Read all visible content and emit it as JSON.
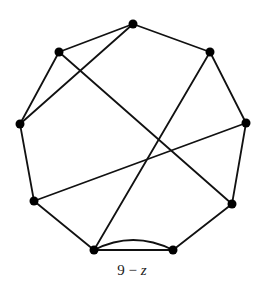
{
  "figure": {
    "caption_number": "9",
    "caption_operator": "−",
    "caption_variable": "z"
  },
  "graph": {
    "vertices": [
      {
        "id": "v_top",
        "x": 133,
        "y": 24
      },
      {
        "id": "v_top_right",
        "x": 210,
        "y": 52
      },
      {
        "id": "v_right",
        "x": 246,
        "y": 123
      },
      {
        "id": "v_lower_right",
        "x": 232,
        "y": 204
      },
      {
        "id": "v_bottom_right",
        "x": 173,
        "y": 250
      },
      {
        "id": "v_bottom_left",
        "x": 94,
        "y": 250
      },
      {
        "id": "v_lower_left",
        "x": 34,
        "y": 201
      },
      {
        "id": "v_left",
        "x": 20,
        "y": 124
      },
      {
        "id": "v_top_left",
        "x": 59,
        "y": 52
      }
    ],
    "edges": [
      [
        "v_top_left",
        "v_top"
      ],
      [
        "v_top",
        "v_top_right"
      ],
      [
        "v_top_right",
        "v_right"
      ],
      [
        "v_right",
        "v_lower_right"
      ],
      [
        "v_lower_right",
        "v_bottom_right"
      ],
      [
        "v_bottom_right",
        "v_bottom_left"
      ],
      [
        "v_bottom_right",
        "v_bottom_left",
        "arc"
      ],
      [
        "v_bottom_left",
        "v_lower_left"
      ],
      [
        "v_lower_left",
        "v_left"
      ],
      [
        "v_left",
        "v_top_left"
      ],
      [
        "v_top_left",
        "v_lower_right"
      ],
      [
        "v_top",
        "v_left"
      ],
      [
        "v_top_right",
        "v_bottom_left"
      ],
      [
        "v_right",
        "v_lower_left"
      ]
    ],
    "vertex_count": 9,
    "edge_count": 14
  }
}
